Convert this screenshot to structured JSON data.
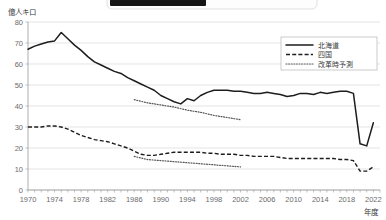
{
  "chart_data": {
    "type": "line",
    "title": "",
    "xlabel": "年度",
    "ylabel": "億人キロ",
    "ylim": [
      0,
      80
    ],
    "xlim": [
      1970,
      2023
    ],
    "ytick_step": 10,
    "yticks": [
      "0",
      "10",
      "20",
      "30",
      "40",
      "50",
      "60",
      "70",
      "80"
    ],
    "xticks": [
      "1970",
      "1974",
      "1978",
      "1982",
      "1986",
      "1990",
      "1994",
      "1998",
      "2002",
      "2006",
      "2010",
      "2014",
      "2018",
      "2022"
    ],
    "grid": "horizontal",
    "legend_position": "top-right",
    "series": [
      {
        "name": "北海道",
        "style": "solid",
        "x": [
          1970,
          1971,
          1972,
          1973,
          1974,
          1975,
          1976,
          1977,
          1978,
          1979,
          1980,
          1981,
          1982,
          1983,
          1984,
          1985,
          1986,
          1987,
          1988,
          1989,
          1990,
          1991,
          1992,
          1993,
          1994,
          1995,
          1996,
          1997,
          1998,
          1999,
          2000,
          2001,
          2002,
          2003,
          2004,
          2005,
          2006,
          2007,
          2008,
          2009,
          2010,
          2011,
          2012,
          2013,
          2014,
          2015,
          2016,
          2017,
          2018,
          2019,
          2020,
          2021,
          2022
        ],
        "values": [
          67,
          68.5,
          69.5,
          70.5,
          71,
          75,
          72,
          69,
          66.5,
          63.5,
          61,
          59.5,
          58,
          56.5,
          55.5,
          53.5,
          52,
          50.5,
          49,
          47.5,
          45,
          43.5,
          42,
          41,
          43.5,
          42.5,
          45,
          46.5,
          47.5,
          47.5,
          47.5,
          47,
          47,
          46.5,
          46,
          46,
          46.5,
          46,
          45.5,
          44.5,
          45,
          46,
          46,
          45.5,
          46.5,
          46,
          46.5,
          47,
          47,
          46,
          22,
          21,
          32
        ]
      },
      {
        "name": "四国",
        "style": "dashed",
        "x": [
          1970,
          1971,
          1972,
          1973,
          1974,
          1975,
          1976,
          1977,
          1978,
          1979,
          1980,
          1981,
          1982,
          1983,
          1984,
          1985,
          1986,
          1987,
          1988,
          1989,
          1990,
          1991,
          1992,
          1993,
          1994,
          1995,
          1996,
          1997,
          1998,
          1999,
          2000,
          2001,
          2002,
          2003,
          2004,
          2005,
          2006,
          2007,
          2008,
          2009,
          2010,
          2011,
          2012,
          2013,
          2014,
          2015,
          2016,
          2017,
          2018,
          2019,
          2020,
          2021,
          2022
        ],
        "values": [
          30,
          30,
          30,
          30.5,
          30.5,
          30,
          29,
          27.5,
          26,
          25,
          24,
          23.5,
          23,
          22,
          21,
          20,
          18.5,
          17,
          16.5,
          16.5,
          17,
          17.5,
          18,
          18,
          18,
          18,
          18,
          17.5,
          17.5,
          17,
          17,
          17,
          16.5,
          16.5,
          16,
          16,
          16,
          16,
          15.5,
          15,
          15,
          15,
          15,
          15,
          15,
          15,
          15,
          14.5,
          14.5,
          14,
          9,
          9,
          11
        ]
      },
      {
        "name": "改革時予測",
        "style": "dotted",
        "note": "upper forecast band (Hokkaido) and lower forecast band (Shikoku), both drawn from 1986 to 2002",
        "branches": [
          {
            "x": [
              1986,
              1988,
              1990,
              1992,
              1994,
              1996,
              1998,
              2000,
              2002
            ],
            "values": [
              43,
              41.5,
              40.5,
              39.5,
              38,
              37,
              35.5,
              34.5,
              33.5
            ]
          },
          {
            "x": [
              1986,
              1988,
              1990,
              1992,
              1994,
              1996,
              1998,
              2000,
              2002
            ],
            "values": [
              16,
              14.5,
              14,
              13.5,
              13,
              12.5,
              12,
              11.5,
              11
            ]
          }
        ]
      }
    ]
  },
  "legend": {
    "items": [
      {
        "label": "北海道",
        "style": "solid"
      },
      {
        "label": "四国",
        "style": "dashed"
      },
      {
        "label": "改革時予測",
        "style": "dotted"
      }
    ]
  },
  "overlay": {
    "redacted_label": ""
  }
}
